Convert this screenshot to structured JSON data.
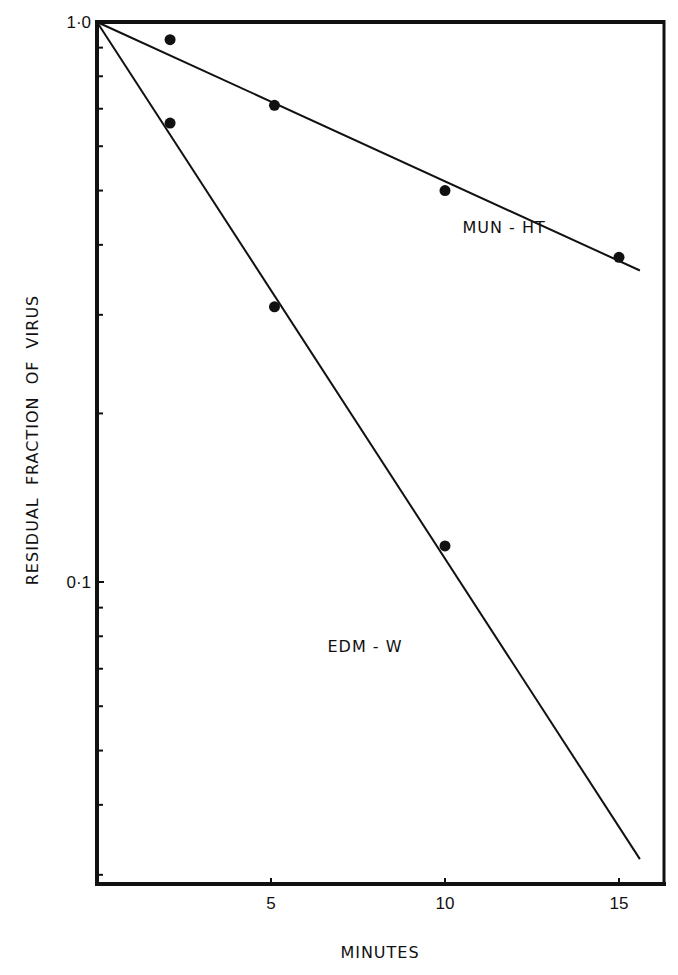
{
  "chart_data": {
    "type": "scatter",
    "title": "",
    "xlabel": "MINUTES",
    "ylabel": "RESIDUAL  FRACTION  OF  VIRUS",
    "xscale": "linear",
    "yscale": "log",
    "xlim": [
      0,
      16.4
    ],
    "ylim": [
      0.029,
      1.0
    ],
    "x_ticks": [
      5,
      10,
      15
    ],
    "x_tick_labels": [
      "5",
      "10",
      "15"
    ],
    "y_ticks_labeled": [
      1.0,
      0.1
    ],
    "y_tick_labels": [
      "1·0",
      "0·1"
    ],
    "y_minor_ticks": [
      0.9,
      0.8,
      0.7,
      0.6,
      0.5,
      0.4,
      0.3,
      0.2,
      0.09,
      0.08,
      0.07,
      0.06,
      0.05,
      0.04,
      0.03
    ],
    "grid": false,
    "legend": "none (series labeled inline)",
    "series": [
      {
        "name": "MUN-HT",
        "label_position": {
          "x": 11.7,
          "y": 0.42
        },
        "points": [
          {
            "x": 2.1,
            "y": 0.93
          },
          {
            "x": 5.1,
            "y": 0.71
          },
          {
            "x": 10.0,
            "y": 0.5
          },
          {
            "x": 15.0,
            "y": 0.38
          }
        ],
        "fit_line": {
          "x0": 0,
          "y0": 1.0,
          "x1": 15.6,
          "y1": 0.36
        }
      },
      {
        "name": "EDM-W",
        "label_position": {
          "x": 7.7,
          "y": 0.075
        },
        "points": [
          {
            "x": 2.1,
            "y": 0.66
          },
          {
            "x": 5.1,
            "y": 0.31
          },
          {
            "x": 10.0,
            "y": 0.116
          }
        ],
        "fit_line": {
          "x0": 0,
          "y0": 1.0,
          "x1": 15.6,
          "y1": 0.032
        }
      }
    ]
  },
  "layout": {
    "plot_left": 97,
    "plot_right": 664,
    "plot_top": 22,
    "plot_bottom": 884,
    "px_per_minute": 34.8,
    "px_per_decade": 560,
    "line_color": "#111111",
    "point_color": "#111111"
  }
}
